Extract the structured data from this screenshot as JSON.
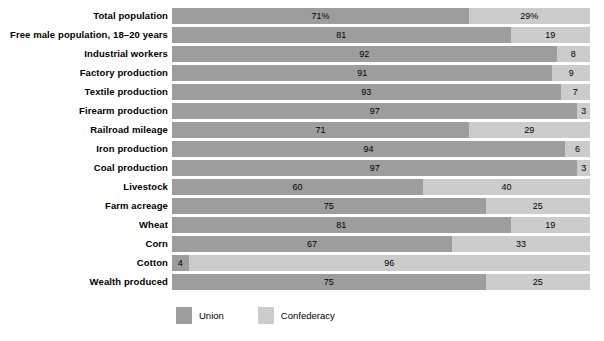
{
  "chart_data": {
    "type": "bar",
    "subtype": "stacked-horizontal-100-percent",
    "title": "",
    "subtitle": "",
    "xlabel": "",
    "ylabel": "",
    "xlim": [
      0,
      100
    ],
    "grid": false,
    "legend_position": "bottom-left",
    "categories": [
      "Total population",
      "Free male population, 18–20 years",
      "Industrial workers",
      "Factory production",
      "Textile production",
      "Firearm production",
      "Railroad mileage",
      "Iron production",
      "Coal production",
      "Livestock",
      "Farm acreage",
      "Wheat",
      "Corn",
      "Cotton",
      "Wealth produced"
    ],
    "series": [
      {
        "name": "Union",
        "color": "#9d9d9d",
        "values": [
          71,
          81,
          92,
          91,
          93,
          97,
          71,
          94,
          97,
          60,
          75,
          81,
          67,
          4,
          75
        ],
        "labels": [
          "71%",
          "81",
          "92",
          "91",
          "93",
          "97",
          "71",
          "94",
          "97",
          "60",
          "75",
          "81",
          "67",
          "4",
          "75"
        ]
      },
      {
        "name": "Confederacy",
        "color": "#cccccc",
        "values": [
          29,
          19,
          8,
          9,
          7,
          3,
          29,
          6,
          3,
          40,
          25,
          19,
          33,
          96,
          25
        ],
        "labels": [
          "29%",
          "19",
          "8",
          "9",
          "7",
          "3",
          "29",
          "6",
          "3",
          "40",
          "25",
          "19",
          "33",
          "96",
          "25"
        ]
      }
    ]
  },
  "rows": [
    {
      "label": "Total population",
      "union": 71,
      "confederacy": 29,
      "union_label": "71%",
      "confederacy_label": "29%"
    },
    {
      "label": "Free male population, 18–20 years",
      "union": 81,
      "confederacy": 19,
      "union_label": "81",
      "confederacy_label": "19"
    },
    {
      "label": "Industrial workers",
      "union": 92,
      "confederacy": 8,
      "union_label": "92",
      "confederacy_label": "8"
    },
    {
      "label": "Factory production",
      "union": 91,
      "confederacy": 9,
      "union_label": "91",
      "confederacy_label": "9"
    },
    {
      "label": "Textile production",
      "union": 93,
      "confederacy": 7,
      "union_label": "93",
      "confederacy_label": "7"
    },
    {
      "label": "Firearm production",
      "union": 97,
      "confederacy": 3,
      "union_label": "97",
      "confederacy_label": "3"
    },
    {
      "label": "Railroad mileage",
      "union": 71,
      "confederacy": 29,
      "union_label": "71",
      "confederacy_label": "29"
    },
    {
      "label": "Iron production",
      "union": 94,
      "confederacy": 6,
      "union_label": "94",
      "confederacy_label": "6"
    },
    {
      "label": "Coal production",
      "union": 97,
      "confederacy": 3,
      "union_label": "97",
      "confederacy_label": "3"
    },
    {
      "label": "Livestock",
      "union": 60,
      "confederacy": 40,
      "union_label": "60",
      "confederacy_label": "40"
    },
    {
      "label": "Farm acreage",
      "union": 75,
      "confederacy": 25,
      "union_label": "75",
      "confederacy_label": "25"
    },
    {
      "label": "Wheat",
      "union": 81,
      "confederacy": 19,
      "union_label": "81",
      "confederacy_label": "19"
    },
    {
      "label": "Corn",
      "union": 67,
      "confederacy": 33,
      "union_label": "67",
      "confederacy_label": "33"
    },
    {
      "label": "Cotton",
      "union": 4,
      "confederacy": 96,
      "union_label": "4",
      "confederacy_label": "96"
    },
    {
      "label": "Wealth produced",
      "union": 75,
      "confederacy": 25,
      "union_label": "75",
      "confederacy_label": "25"
    }
  ],
  "legend": {
    "items": [
      {
        "label": "Union",
        "color": "#9d9d9d"
      },
      {
        "label": "Confederacy",
        "color": "#cccccc"
      }
    ]
  }
}
